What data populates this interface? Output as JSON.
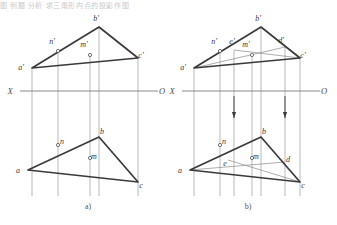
{
  "figure": {
    "title_fragment": "图   例题 分析 求三角形内点的投影作图",
    "background_color": "#ffffff",
    "ink_color": "#3a3a3a",
    "thin_color": "#8a8a8a",
    "axis_color": "#7d7d7d"
  },
  "captions": [
    {
      "name": "caption-a",
      "label": "a)",
      "x": 88,
      "y": 209
    },
    {
      "name": "caption-b",
      "label": "b)",
      "x": 248,
      "y": 209
    }
  ],
  "diagrams": [
    {
      "id": "a",
      "caption": "a)",
      "axis": {
        "left_label": "X",
        "right_label": "O",
        "y": 91,
        "x_start": 20,
        "x_end": 158,
        "left_label_x": 10,
        "right_label_x": 162
      },
      "points_upper": [
        {
          "name": "a-prime",
          "label": "a'",
          "x": 32,
          "y": 68,
          "lx": 21,
          "ly": 70,
          "marker": "vertex"
        },
        {
          "name": "b-prime",
          "label": "b'",
          "x": 99,
          "y": 27,
          "lx": 96,
          "ly": 21,
          "marker": "vertex"
        },
        {
          "name": "c-prime",
          "label": "c'",
          "x": 138,
          "y": 58,
          "lx": 141,
          "ly": 58,
          "marker": "vertex"
        },
        {
          "name": "n-prime",
          "label": "n'",
          "x": 58,
          "y": 51,
          "lx": 52,
          "ly": 44,
          "marker": "circle"
        },
        {
          "name": "m-prime",
          "label": "m'",
          "x": 90,
          "y": 55,
          "lx": 84,
          "ly": 47,
          "marker": "circle"
        }
      ],
      "points_lower": [
        {
          "name": "a-point",
          "label": "a",
          "x": 28,
          "y": 170,
          "lx": 18,
          "ly": 173,
          "marker": "vertex"
        },
        {
          "name": "b-point",
          "label": "b",
          "x": 99,
          "y": 137,
          "lx": 102,
          "ly": 134,
          "marker": "vertex"
        },
        {
          "name": "c-point",
          "label": "c",
          "x": 138,
          "y": 182,
          "lx": 141,
          "ly": 188,
          "marker": "vertex"
        },
        {
          "name": "n-point",
          "label": "n",
          "x": 58,
          "y": 145,
          "lx": 62,
          "ly": 144,
          "marker": "circle"
        },
        {
          "name": "m-point",
          "label": "m",
          "x": 90,
          "y": 158,
          "lx": 94,
          "ly": 159,
          "marker": "circle"
        }
      ],
      "triangle_upper": "32,68 99,27 138,58",
      "triangle_lower": "28,170 99,137 138,182",
      "projectors": [
        {
          "name": "projector-a",
          "x": 32,
          "y1": 68,
          "y2": 196
        },
        {
          "name": "projector-n",
          "x": 58,
          "y1": 51,
          "y2": 196
        },
        {
          "name": "projector-m",
          "x": 90,
          "y1": 55,
          "y2": 196
        },
        {
          "name": "projector-b",
          "x": 99,
          "y1": 27,
          "y2": 196
        },
        {
          "name": "projector-c",
          "x": 138,
          "y1": 58,
          "y2": 196
        }
      ],
      "aux_lines": [],
      "arrows": []
    },
    {
      "id": "b",
      "caption": "b)",
      "axis": {
        "left_label": "X",
        "right_label": "O",
        "y": 91,
        "x_start": 182,
        "x_end": 320,
        "left_label_x": 172,
        "right_label_x": 324
      },
      "points_upper": [
        {
          "name": "a-prime",
          "label": "a'",
          "x": 194,
          "y": 68,
          "lx": 183,
          "ly": 70,
          "marker": "vertex"
        },
        {
          "name": "b-prime",
          "label": "b'",
          "x": 261,
          "y": 27,
          "lx": 258,
          "ly": 21,
          "marker": "vertex"
        },
        {
          "name": "c-prime",
          "label": "c'",
          "x": 300,
          "y": 58,
          "lx": 303,
          "ly": 58,
          "marker": "vertex"
        },
        {
          "name": "n-prime",
          "label": "n'",
          "x": 220,
          "y": 51,
          "lx": 214,
          "ly": 44,
          "marker": "circle"
        },
        {
          "name": "e-prime",
          "label": "e'",
          "x": 234,
          "y": 50,
          "lx": 232,
          "ly": 44,
          "marker": "none"
        },
        {
          "name": "m-prime",
          "label": "m'",
          "x": 252,
          "y": 55,
          "lx": 246,
          "ly": 47,
          "marker": "circle"
        },
        {
          "name": "d-prime",
          "label": "d'",
          "x": 285,
          "y": 47,
          "lx": 281,
          "ly": 43,
          "marker": "none"
        }
      ],
      "points_lower": [
        {
          "name": "a-point",
          "label": "a",
          "x": 190,
          "y": 170,
          "lx": 180,
          "ly": 173,
          "marker": "vertex"
        },
        {
          "name": "b-point",
          "label": "b",
          "x": 261,
          "y": 137,
          "lx": 264,
          "ly": 134,
          "marker": "vertex"
        },
        {
          "name": "c-point",
          "label": "c",
          "x": 300,
          "y": 182,
          "lx": 303,
          "ly": 188,
          "marker": "vertex"
        },
        {
          "name": "n-point",
          "label": "n",
          "x": 220,
          "y": 145,
          "lx": 224,
          "ly": 144,
          "marker": "circle"
        },
        {
          "name": "e-point",
          "label": "e",
          "x": 228,
          "y": 160,
          "lx": 225,
          "ly": 166,
          "marker": "none"
        },
        {
          "name": "m-point",
          "label": "m",
          "x": 252,
          "y": 158,
          "lx": 256,
          "ly": 159,
          "marker": "circle"
        },
        {
          "name": "d-point",
          "label": "d",
          "x": 285,
          "y": 162,
          "lx": 288,
          "ly": 162,
          "marker": "none"
        }
      ],
      "triangle_upper": "194,68 261,27 300,58",
      "triangle_lower": "190,170 261,137 300,182",
      "projectors": [
        {
          "name": "projector-a",
          "x": 194,
          "y1": 68,
          "y2": 196
        },
        {
          "name": "projector-n",
          "x": 220,
          "y1": 51,
          "y2": 196
        },
        {
          "name": "projector-e",
          "x": 234,
          "y1": 50,
          "y2": 196
        },
        {
          "name": "projector-m",
          "x": 252,
          "y1": 55,
          "y2": 196
        },
        {
          "name": "projector-b",
          "x": 261,
          "y1": 27,
          "y2": 196
        },
        {
          "name": "projector-d",
          "x": 285,
          "y1": 47,
          "y2": 196
        },
        {
          "name": "projector-c",
          "x": 300,
          "y1": 58,
          "y2": 196
        }
      ],
      "aux_lines": [
        {
          "name": "aux-upper-a-to-d",
          "x1": 194,
          "y1": 68,
          "x2": 285,
          "y2": 47
        },
        {
          "name": "aux-upper-e-to-c",
          "x1": 234,
          "y1": 50,
          "x2": 300,
          "y2": 58
        },
        {
          "name": "aux-lower-a-to-d",
          "x1": 190,
          "y1": 170,
          "x2": 285,
          "y2": 162
        },
        {
          "name": "aux-lower-e-to-c",
          "x1": 228,
          "y1": 160,
          "x2": 300,
          "y2": 182
        }
      ],
      "arrows": [
        {
          "name": "arrow-down-e",
          "x": 234,
          "y_tip": 118,
          "y_tail": 96
        },
        {
          "name": "arrow-down-d",
          "x": 285,
          "y_tip": 118,
          "y_tail": 96
        }
      ]
    }
  ]
}
